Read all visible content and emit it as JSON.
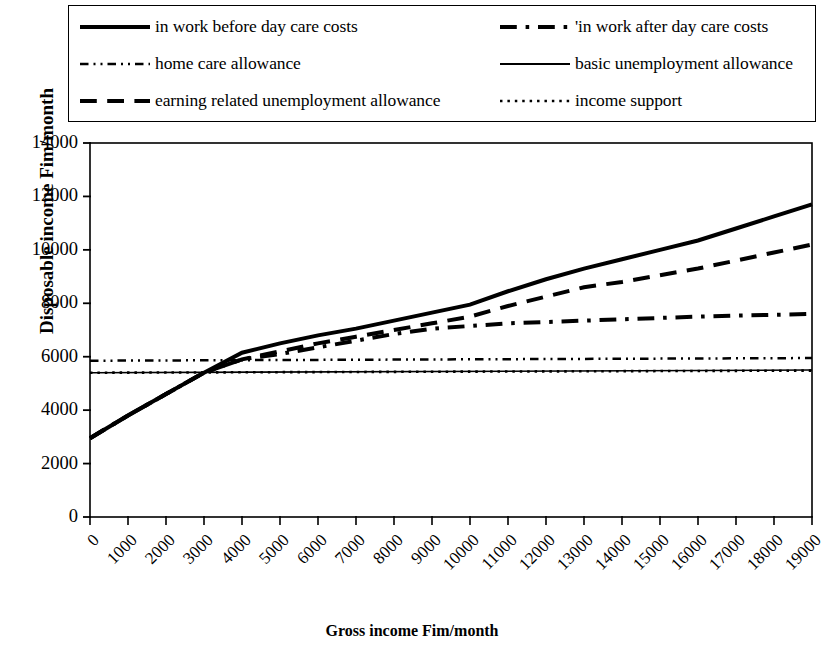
{
  "chart_data": {
    "type": "line",
    "title": "",
    "xlabel": "Gross income Fim/month",
    "ylabel": "Disposable income Fim/month",
    "xlim": [
      0,
      19000
    ],
    "ylim": [
      0,
      14000
    ],
    "ytick_values": [
      0,
      2000,
      4000,
      6000,
      8000,
      10000,
      12000,
      14000
    ],
    "ytick_labels": [
      "0",
      "2000",
      "4000",
      "6000",
      "8000",
      "10000",
      "12000",
      "14000"
    ],
    "xtick_values": [
      0,
      1000,
      2000,
      3000,
      4000,
      5000,
      6000,
      7000,
      8000,
      9000,
      10000,
      11000,
      12000,
      13000,
      14000,
      15000,
      16000,
      17000,
      18000,
      19000
    ],
    "xtick_labels": [
      "0",
      "1000",
      "2000",
      "3000",
      "4000",
      "5000",
      "6000",
      "7000",
      "8000",
      "9000",
      "10000",
      "11000",
      "12000",
      "13000",
      "14000",
      "15000",
      "16000",
      "17000",
      "18000",
      "19000"
    ],
    "grid": false,
    "legend_position": "above-plot",
    "series": [
      {
        "name": "in work before day care costs",
        "style": "solid",
        "width": 4.0,
        "color": "#000000",
        "x": [
          0,
          1000,
          2000,
          3000,
          4000,
          5000,
          6000,
          7000,
          8000,
          9000,
          10000,
          11000,
          12000,
          13000,
          14000,
          15000,
          16000,
          17000,
          18000,
          19000
        ],
        "y": [
          2950,
          3800,
          4600,
          5400,
          6150,
          6500,
          6800,
          7050,
          7350,
          7650,
          7950,
          8450,
          8900,
          9300,
          9650,
          10000,
          10350,
          10800,
          11250,
          11700
        ]
      },
      {
        "name": "in work after day care costs",
        "style": "dashdot",
        "width": 4.0,
        "color": "#000000",
        "x": [
          0,
          1000,
          2000,
          3000,
          4000,
          5000,
          6000,
          7000,
          8000,
          9000,
          10000,
          11000,
          12000,
          13000,
          14000,
          15000,
          16000,
          17000,
          18000,
          19000
        ],
        "y": [
          2950,
          3800,
          4600,
          5400,
          5900,
          6100,
          6350,
          6600,
          6850,
          7050,
          7150,
          7250,
          7300,
          7350,
          7400,
          7450,
          7500,
          7540,
          7570,
          7600
        ]
      },
      {
        "name": "home care allowance",
        "style": "dashdotdot",
        "width": 2.5,
        "color": "#000000",
        "x": [
          0,
          19000
        ],
        "y": [
          5850,
          5950
        ]
      },
      {
        "name": "basic unemployment allowance",
        "style": "solid",
        "width": 1.6,
        "color": "#000000",
        "x": [
          0,
          19000
        ],
        "y": [
          5400,
          5500
        ]
      },
      {
        "name": "earning related unemployment allowance",
        "style": "dashed",
        "width": 4.0,
        "color": "#000000",
        "x": [
          0,
          1000,
          2000,
          3000,
          4000,
          5000,
          6000,
          7000,
          8000,
          9000,
          10000,
          11000,
          12000,
          13000,
          14000,
          15000,
          16000,
          17000,
          18000,
          19000
        ],
        "y": [
          2950,
          3800,
          4600,
          5400,
          5900,
          6200,
          6500,
          6750,
          7000,
          7250,
          7500,
          7900,
          8250,
          8600,
          8800,
          9050,
          9300,
          9600,
          9900,
          10200
        ]
      },
      {
        "name": "income support",
        "style": "dotted",
        "width": 2.6,
        "color": "#000000",
        "x": [
          0,
          19000
        ],
        "y": [
          5400,
          5480
        ]
      }
    ]
  },
  "legend": {
    "rows": [
      [
        {
          "label": "in work before day care costs",
          "series": 0
        },
        {
          "label": "'in work after day care costs",
          "series": 1
        }
      ],
      [
        {
          "label": "home care allowance",
          "series": 2
        },
        {
          "label": "basic unemployment allowance",
          "series": 3
        }
      ],
      [
        {
          "label": "earning related unemployment allowance",
          "series": 4
        },
        {
          "label": "income support",
          "series": 5
        }
      ]
    ]
  }
}
